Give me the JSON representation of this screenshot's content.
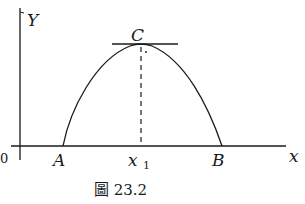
{
  "diagram": {
    "axes": {
      "y_label": "Y",
      "x_label": "x",
      "origin_label": "0"
    },
    "points": {
      "A": "A",
      "B": "B",
      "C": "C",
      "x1_base": "x",
      "x1_sub": "1"
    },
    "caption": "圖 23.2"
  }
}
